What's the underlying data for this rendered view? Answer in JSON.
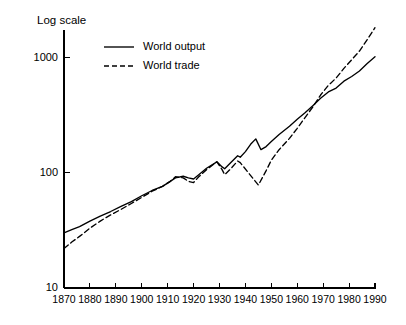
{
  "chart_data": {
    "type": "line",
    "title": "Log scale",
    "xlabel": "",
    "ylabel": "Log scale",
    "log_y": true,
    "grid": false,
    "legend_position": "top-center",
    "xlim": [
      1870,
      1990
    ],
    "ylim": [
      10,
      2000
    ],
    "xticks": [
      1870,
      1880,
      1890,
      1900,
      1910,
      1920,
      1930,
      1940,
      1950,
      1960,
      1970,
      1980,
      1990
    ],
    "xtick_labels": [
      "1870",
      "1880",
      "1890",
      "1900",
      "1910",
      "1920",
      "1930",
      "1940",
      "1950",
      "1960",
      "1970",
      "1980",
      "1990"
    ],
    "yticks": [
      10,
      100,
      1000
    ],
    "ytick_labels": [
      "10",
      "100",
      "1000"
    ],
    "series": [
      {
        "name": "World output",
        "style": "solid",
        "color": "#000000",
        "x": [
          1870,
          1873,
          1876,
          1880,
          1884,
          1888,
          1892,
          1896,
          1900,
          1904,
          1908,
          1911,
          1913,
          1916,
          1918,
          1920,
          1922,
          1925,
          1929,
          1931,
          1932,
          1934,
          1937,
          1938,
          1940,
          1942,
          1944,
          1946,
          1948,
          1950,
          1953,
          1957,
          1960,
          1963,
          1966,
          1969,
          1972,
          1975,
          1978,
          1981,
          1984,
          1987,
          1990
        ],
        "values": [
          30,
          32,
          34,
          38,
          42,
          46,
          51,
          56,
          63,
          70,
          76,
          84,
          90,
          93,
          90,
          88,
          96,
          109,
          124,
          112,
          108,
          120,
          140,
          136,
          152,
          176,
          196,
          158,
          168,
          186,
          214,
          252,
          290,
          330,
          380,
          440,
          500,
          540,
          620,
          680,
          760,
          880,
          1010
        ]
      },
      {
        "name": "World trade",
        "style": "dashed",
        "color": "#000000",
        "x": [
          1870,
          1873,
          1876,
          1880,
          1884,
          1888,
          1892,
          1896,
          1900,
          1904,
          1908,
          1911,
          1913,
          1916,
          1918,
          1920,
          1922,
          1925,
          1929,
          1931,
          1932,
          1934,
          1937,
          1938,
          1945,
          1948,
          1950,
          1953,
          1957,
          1960,
          1963,
          1966,
          1969,
          1972,
          1975,
          1978,
          1981,
          1984,
          1987,
          1990
        ],
        "values": [
          22,
          25,
          28,
          33,
          38,
          43,
          48,
          54,
          61,
          69,
          76,
          84,
          92,
          90,
          84,
          82,
          92,
          106,
          124,
          106,
          96,
          106,
          126,
          122,
          78,
          104,
          128,
          158,
          198,
          242,
          300,
          370,
          470,
          570,
          660,
          800,
          950,
          1130,
          1420,
          1800
        ]
      }
    ],
    "annotations": []
  },
  "legend": {
    "items": [
      {
        "label": "World output",
        "style": "solid"
      },
      {
        "label": "World trade",
        "style": "dashed"
      }
    ]
  },
  "axis": {
    "y_title": "Log scale"
  }
}
